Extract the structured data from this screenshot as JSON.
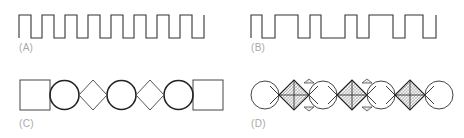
{
  "figure": {
    "panels": [
      {
        "id": "A",
        "label": "(A)",
        "description": "regular square wave",
        "type": "square-wave",
        "stroke": "#333333",
        "high_y": 15,
        "low_y": 38,
        "transitions_x": [
          19,
          31,
          42,
          54,
          65,
          77,
          88,
          100,
          111,
          123,
          134,
          146,
          157,
          169,
          180,
          192,
          204
        ]
      },
      {
        "id": "B",
        "label": "(B)",
        "description": "irregular square wave",
        "type": "square-wave",
        "stroke": "#333333",
        "high_y": 15,
        "low_y": 38,
        "transitions_x": [
          251,
          262,
          275,
          298,
          310,
          321,
          345,
          357,
          369,
          393,
          405,
          423,
          436
        ]
      },
      {
        "id": "C",
        "label": "(C)",
        "description": "square, circle, diamond, circle, diamond, circle, square sequence",
        "type": "shape-sequence",
        "shapes": [
          "square",
          "circle",
          "diamond",
          "circle",
          "diamond",
          "circle",
          "square"
        ]
      },
      {
        "id": "D",
        "label": "(D)",
        "description": "circles alternating with hatched diamonds",
        "type": "shape-sequence",
        "shapes": [
          "circle",
          "hatched-diamond",
          "circle",
          "hatched-diamond",
          "circle",
          "hatched-diamond",
          "circle"
        ]
      }
    ],
    "colors": {
      "line": "#333333",
      "label": "#a8a8a8",
      "hatch": "#555555"
    }
  }
}
